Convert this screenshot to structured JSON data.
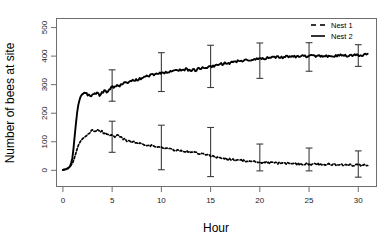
{
  "chart_data": {
    "type": "line",
    "title": "",
    "xlabel": "Hour",
    "ylabel": "Number of bees at site",
    "xlim": [
      -0.6,
      31.8
    ],
    "ylim": [
      -55,
      530
    ],
    "xticks": [
      0,
      5,
      10,
      15,
      20,
      25,
      30
    ],
    "yticks": [
      0,
      100,
      200,
      300,
      400,
      500
    ],
    "xtick_labels": [
      "0",
      "5",
      "10",
      "15",
      "20",
      "25",
      "30"
    ],
    "ytick_labels": [
      "0",
      "100",
      "200",
      "300",
      "400",
      "500"
    ],
    "grid": false,
    "legend_position": "top-right",
    "series": [
      {
        "name": "Nest 1",
        "style": "dashed",
        "color": "#000000",
        "x": [
          0,
          0.25,
          0.5,
          0.75,
          1,
          1.25,
          1.5,
          1.75,
          2,
          2.25,
          2.5,
          2.75,
          3,
          3.25,
          3.5,
          3.75,
          4,
          4.25,
          4.5,
          4.75,
          5,
          5.25,
          5.5,
          5.75,
          6,
          6.5,
          7,
          7.5,
          8,
          8.5,
          9,
          9.5,
          10,
          10.5,
          11,
          11.5,
          12,
          12.5,
          13,
          13.5,
          14,
          14.5,
          15,
          15.5,
          16,
          16.5,
          17,
          17.5,
          18,
          18.5,
          19,
          19.5,
          20,
          21,
          22,
          23,
          24,
          25,
          26,
          27,
          28,
          29,
          30,
          31
        ],
        "values": [
          2,
          4,
          8,
          14,
          26,
          52,
          82,
          100,
          110,
          118,
          126,
          134,
          140,
          137,
          141,
          134,
          137,
          128,
          131,
          124,
          121,
          116,
          122,
          117,
          112,
          104,
          100,
          96,
          93,
          90,
          86,
          82,
          79,
          77,
          74,
          70,
          67,
          66,
          64,
          62,
          58,
          54,
          51,
          47,
          44,
          41,
          39,
          37,
          35,
          33,
          31,
          29,
          28,
          26,
          25,
          24,
          23,
          22,
          21,
          21,
          20,
          19,
          18,
          17
        ]
      },
      {
        "name": "Nest 2",
        "style": "solid",
        "color": "#000000",
        "x": [
          0,
          0.25,
          0.5,
          0.75,
          1,
          1.25,
          1.5,
          1.75,
          2,
          2.25,
          2.5,
          2.75,
          3,
          3.25,
          3.5,
          3.75,
          4,
          4.25,
          4.5,
          4.75,
          5,
          5.25,
          5.5,
          5.75,
          6,
          6.5,
          7,
          7.5,
          8,
          8.5,
          9,
          9.5,
          10,
          10.5,
          11,
          11.5,
          12,
          12.5,
          13,
          13.5,
          14,
          14.5,
          15,
          15.5,
          16,
          16.5,
          17,
          17.5,
          18,
          18.5,
          19,
          19.5,
          20,
          21,
          22,
          23,
          24,
          25,
          26,
          27,
          28,
          29,
          30,
          31
        ],
        "values": [
          1,
          3,
          6,
          14,
          48,
          140,
          220,
          255,
          268,
          272,
          266,
          259,
          264,
          272,
          268,
          262,
          272,
          281,
          274,
          285,
          296,
          289,
          300,
          292,
          303,
          308,
          313,
          318,
          324,
          329,
          333,
          337,
          341,
          344,
          346,
          349,
          351,
          354,
          349,
          352,
          357,
          360,
          364,
          368,
          371,
          374,
          377,
          380,
          383,
          386,
          388,
          390,
          391,
          394,
          396,
          398,
          399,
          400,
          401,
          401,
          402,
          403,
          404,
          405
        ]
      }
    ],
    "errorbars": [
      {
        "series": "Nest 1",
        "x": 5,
        "y": 118,
        "lower": 63,
        "upper": 172
      },
      {
        "series": "Nest 1",
        "x": 10,
        "y": 79,
        "lower": 2,
        "upper": 158
      },
      {
        "series": "Nest 1",
        "x": 15,
        "y": 51,
        "lower": -22,
        "upper": 150
      },
      {
        "series": "Nest 1",
        "x": 20,
        "y": 28,
        "lower": -2,
        "upper": 92
      },
      {
        "series": "Nest 1",
        "x": 25,
        "y": 22,
        "lower": -2,
        "upper": 78
      },
      {
        "series": "Nest 1",
        "x": 30,
        "y": 18,
        "lower": -24,
        "upper": 68
      },
      {
        "series": "Nest 2",
        "x": 5,
        "y": 296,
        "lower": 242,
        "upper": 352
      },
      {
        "series": "Nest 2",
        "x": 10,
        "y": 341,
        "lower": 276,
        "upper": 412
      },
      {
        "series": "Nest 2",
        "x": 15,
        "y": 364,
        "lower": 290,
        "upper": 438
      },
      {
        "series": "Nest 2",
        "x": 20,
        "y": 391,
        "lower": 322,
        "upper": 446
      },
      {
        "series": "Nest 2",
        "x": 25,
        "y": 400,
        "lower": 347,
        "upper": 447
      },
      {
        "series": "Nest 2",
        "x": 30,
        "y": 404,
        "lower": 364,
        "upper": 440
      }
    ]
  },
  "legend": {
    "entries": [
      {
        "label": "Nest 1",
        "style": "dashed"
      },
      {
        "label": "Nest 2",
        "style": "solid"
      }
    ]
  },
  "axes": {
    "x_title": "Hour",
    "y_title": "Number of bees at site"
  }
}
